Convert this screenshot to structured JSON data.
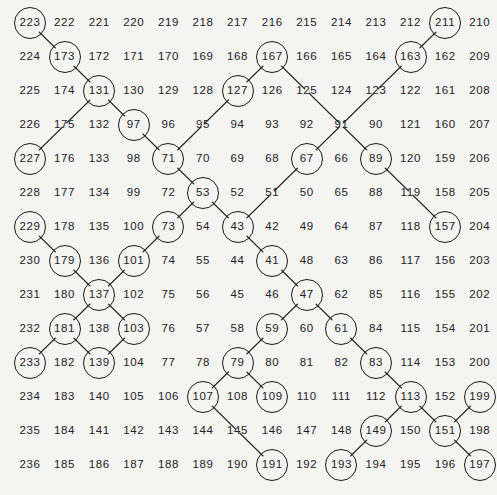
{
  "figure": {
    "name": "ulam-spiral",
    "grid_rows": 14,
    "grid_cols": 14,
    "ink_color": "#1c1a18",
    "paper_color": "#f4f4f2",
    "origin_x": 30,
    "origin_y": 23,
    "col_step": 34.6,
    "row_step": 34.0,
    "circle_radius": 16
  },
  "chart_data": {
    "type": "scatter",
    "title": "",
    "xlabel": "",
    "ylabel": "",
    "grid": false,
    "legend": null,
    "rows": [
      [
        "223",
        "222",
        "221",
        "220",
        "219",
        "218",
        "217",
        "216",
        "215",
        "214",
        "213",
        "212",
        "211",
        "210"
      ],
      [
        "224",
        "173",
        "172",
        "171",
        "170",
        "169",
        "168",
        "167",
        "166",
        "165",
        "164",
        "163",
        "162",
        "209"
      ],
      [
        "225",
        "174",
        "131",
        "130",
        "129",
        "128",
        "127",
        "126",
        "125",
        "124",
        "123",
        "122",
        "161",
        "208"
      ],
      [
        "226",
        "175",
        "132",
        "97",
        "96",
        "95",
        "94",
        "93",
        "92",
        "91",
        "90",
        "121",
        "160",
        "207"
      ],
      [
        "227",
        "176",
        "133",
        "98",
        "71",
        "70",
        "69",
        "68",
        "67",
        "66",
        "89",
        "120",
        "159",
        "206"
      ],
      [
        "228",
        "177",
        "134",
        "99",
        "72",
        "53",
        "52",
        "51",
        "50",
        "65",
        "88",
        "119",
        "158",
        "205"
      ],
      [
        "229",
        "178",
        "135",
        "100",
        "73",
        "54",
        "43",
        "42",
        "49",
        "64",
        "87",
        "118",
        "157",
        "204"
      ],
      [
        "230",
        "179",
        "136",
        "101",
        "74",
        "55",
        "44",
        "41",
        "48",
        "63",
        "86",
        "117",
        "156",
        "203"
      ],
      [
        "231",
        "180",
        "137",
        "102",
        "75",
        "56",
        "45",
        "46",
        "47",
        "62",
        "85",
        "116",
        "155",
        "202"
      ],
      [
        "232",
        "181",
        "138",
        "103",
        "76",
        "57",
        "58",
        "59",
        "60",
        "61",
        "84",
        "115",
        "154",
        "201"
      ],
      [
        "233",
        "182",
        "139",
        "104",
        "77",
        "78",
        "79",
        "80",
        "81",
        "82",
        "83",
        "114",
        "153",
        "200"
      ],
      [
        "234",
        "183",
        "140",
        "105",
        "106",
        "107",
        "108",
        "109",
        "110",
        "111",
        "112",
        "113",
        "152",
        "199"
      ],
      [
        "235",
        "184",
        "141",
        "142",
        "143",
        "144",
        "145",
        "146",
        "147",
        "148",
        "149",
        "150",
        "151",
        "198"
      ],
      [
        "236",
        "185",
        "186",
        "187",
        "188",
        "189",
        "190",
        "191",
        "192",
        "193",
        "194",
        "195",
        "196",
        "197"
      ]
    ],
    "circled": [
      "223",
      "173",
      "211",
      "163",
      "167",
      "131",
      "127",
      "97",
      "71",
      "227",
      "229",
      "53",
      "73",
      "43",
      "157",
      "41",
      "179",
      "101",
      "137",
      "47",
      "181",
      "103",
      "59",
      "61",
      "233",
      "139",
      "79",
      "83",
      "107",
      "109",
      "113",
      "199",
      "149",
      "151",
      "191",
      "193",
      "197",
      "67",
      "89"
    ],
    "links": [
      [
        "223",
        "173"
      ],
      [
        "173",
        "131"
      ],
      [
        "131",
        "97"
      ],
      [
        "131",
        "175"
      ],
      [
        "175",
        "227"
      ],
      [
        "97",
        "71"
      ],
      [
        "71",
        "53"
      ],
      [
        "71",
        "95"
      ],
      [
        "95",
        "127"
      ],
      [
        "127",
        "167"
      ],
      [
        "167",
        "125"
      ],
      [
        "125",
        "91"
      ],
      [
        "91",
        "123"
      ],
      [
        "123",
        "163"
      ],
      [
        "163",
        "211"
      ],
      [
        "91",
        "67"
      ],
      [
        "67",
        "51"
      ],
      [
        "51",
        "43"
      ],
      [
        "91",
        "89"
      ],
      [
        "89",
        "119"
      ],
      [
        "119",
        "157"
      ],
      [
        "53",
        "73"
      ],
      [
        "53",
        "43"
      ],
      [
        "73",
        "101"
      ],
      [
        "101",
        "137"
      ],
      [
        "137",
        "181"
      ],
      [
        "181",
        "233"
      ],
      [
        "181",
        "139"
      ],
      [
        "137",
        "103"
      ],
      [
        "103",
        "139"
      ],
      [
        "229",
        "179"
      ],
      [
        "179",
        "137"
      ],
      [
        "43",
        "41"
      ],
      [
        "41",
        "47"
      ],
      [
        "47",
        "59"
      ],
      [
        "47",
        "61"
      ],
      [
        "59",
        "79"
      ],
      [
        "61",
        "83"
      ],
      [
        "83",
        "113"
      ],
      [
        "79",
        "107"
      ],
      [
        "79",
        "109"
      ],
      [
        "107",
        "145"
      ],
      [
        "145",
        "191"
      ],
      [
        "113",
        "149"
      ],
      [
        "113",
        "151"
      ],
      [
        "149",
        "193"
      ],
      [
        "151",
        "199"
      ],
      [
        "151",
        "197"
      ]
    ]
  }
}
